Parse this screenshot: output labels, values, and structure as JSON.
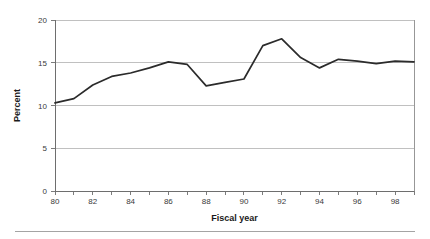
{
  "figure": {
    "background_color": "#ffffff",
    "line_color": "#2b2b2b",
    "gridline_color": "#b0b0b0",
    "axis_color": "#6e6e6e",
    "footer_rule_color": "#9a9a9a"
  },
  "labels": {
    "y_axis_title": "Percent",
    "x_axis_title": "Fiscal year",
    "y_ticks": [
      "0",
      "5",
      "10",
      "15",
      "20"
    ],
    "x_ticks_labeled": [
      "80",
      "82",
      "84",
      "86",
      "88",
      "90",
      "92",
      "94",
      "96",
      "98"
    ]
  },
  "chart_data": {
    "type": "line",
    "title": "",
    "subtitle": "",
    "xlabel": "Fiscal year",
    "ylabel": "Percent",
    "xlim": [
      80,
      99
    ],
    "ylim": [
      0,
      20
    ],
    "ytick_values": [
      0,
      5,
      10,
      15,
      20
    ],
    "xtick_values": [
      80,
      81,
      82,
      83,
      84,
      85,
      86,
      87,
      88,
      89,
      90,
      91,
      92,
      93,
      94,
      95,
      96,
      97,
      98,
      99
    ],
    "xtick_labeled_values": [
      80,
      82,
      84,
      86,
      88,
      90,
      92,
      94,
      96,
      98
    ],
    "grid": "horizontal",
    "legend": "none",
    "markers": "none",
    "x": [
      80,
      81,
      82,
      83,
      84,
      85,
      86,
      87,
      88,
      89,
      90,
      91,
      92,
      93,
      94,
      95,
      96,
      97,
      98,
      99
    ],
    "values": [
      10.3,
      10.8,
      12.4,
      13.4,
      13.8,
      14.4,
      15.1,
      14.8,
      12.3,
      12.7,
      13.1,
      17.0,
      17.8,
      15.6,
      14.4,
      15.4,
      15.2,
      14.9,
      15.2,
      15.1
    ],
    "series": [
      {
        "name": "Percent",
        "color": "#2b2b2b",
        "values": [
          10.3,
          10.8,
          12.4,
          13.4,
          13.8,
          14.4,
          15.1,
          14.8,
          12.3,
          12.7,
          13.1,
          17.0,
          17.8,
          15.6,
          14.4,
          15.4,
          15.2,
          14.9,
          15.2,
          15.1
        ]
      }
    ],
    "annotations": []
  }
}
